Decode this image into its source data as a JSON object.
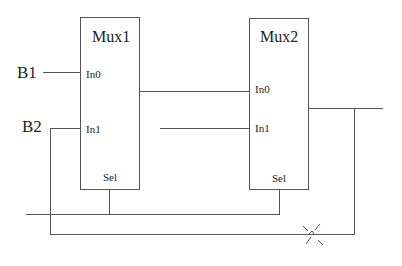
{
  "diagram": {
    "type": "circuit-schematic",
    "inputs": [
      {
        "id": "b1",
        "label": "B1"
      },
      {
        "id": "b2",
        "label": "B2"
      }
    ],
    "blocks": [
      {
        "id": "mux1",
        "title": "Mux1",
        "ports": {
          "in0": "In0",
          "in1": "In1",
          "sel": "Sel"
        }
      },
      {
        "id": "mux2",
        "title": "Mux2",
        "ports": {
          "in0": "In0",
          "in1": "In1",
          "sel": "Sel"
        }
      }
    ],
    "connections": [
      {
        "from": "B1",
        "to": "Mux1.In0"
      },
      {
        "from": "B2",
        "to": "Mux1.In1"
      },
      {
        "from": "Mux1.out",
        "to": "Mux2.In0"
      },
      {
        "from": "unconnected-stub",
        "to": "Mux2.In1"
      },
      {
        "from": "select-bus",
        "to": [
          "Mux1.Sel",
          "Mux2.Sel"
        ]
      },
      {
        "from": "Mux2.out",
        "to": "feedback-loop-to-Mux1.In1"
      }
    ],
    "annotations": [
      {
        "id": "break-mark",
        "description": "X mark indicating a broken/cut feedback wire"
      }
    ],
    "colors": {
      "line": "#555555",
      "text": "#222222",
      "background": "#ffffff"
    }
  }
}
